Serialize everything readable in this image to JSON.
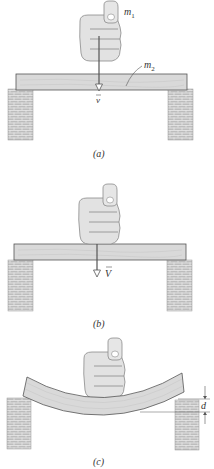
{
  "figure": {
    "panels": [
      {
        "id": "a",
        "caption": "(a)",
        "labels": {
          "fist_mass": "m",
          "fist_mass_sub": "1",
          "plank_mass": "m",
          "plank_mass_sub": "2",
          "velocity": "v"
        },
        "description": "Fist of mass m1 moving downward with velocity v toward plank of mass m2 resting on two brick supports"
      },
      {
        "id": "b",
        "caption": "(b)",
        "labels": {
          "velocity": "V"
        },
        "description": "Fist in contact with plank, both moving downward with common velocity V"
      },
      {
        "id": "c",
        "caption": "(c)",
        "labels": {
          "deflection": "d"
        },
        "description": "Plank bent under fist, maximum deflection d"
      }
    ],
    "colors": {
      "plank_fill": "#d9d9d9",
      "plank_stroke": "#555555",
      "brick_fill": "#bdbdbd",
      "brick_mortar": "#e6e6e6",
      "fist_fill": "#e2e2e2",
      "fist_stroke": "#888888",
      "arrow": "#555555"
    }
  }
}
